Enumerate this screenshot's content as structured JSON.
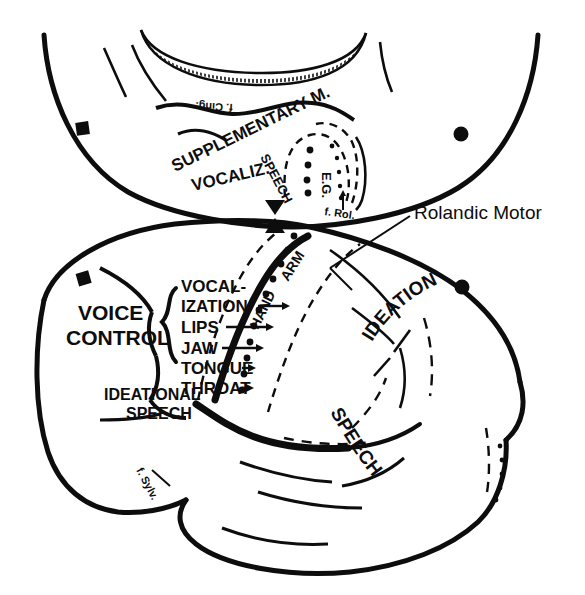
{
  "figure": {
    "kind": "brain-cortical-stimulation-map",
    "views": [
      {
        "name": "medial-view",
        "position": "top"
      },
      {
        "name": "lateral-view",
        "position": "bottom"
      }
    ],
    "ink_color": "#0d0d0d",
    "background_color": "#ffffff"
  },
  "callout": {
    "label": "Rolandic Motor",
    "leader_line": true
  },
  "medial_view": {
    "labels": {
      "supplementary_motor": "SUPPLEMENTARY M.",
      "vocalization": "VOCALIZ.",
      "speech": "SPEECH",
      "eg": "E.G.",
      "fissure_rolandic": "f. Rol.",
      "fissure_cingulate": "f. Cing."
    }
  },
  "lateral_view": {
    "labels": {
      "voice_control_line1": "VOICE",
      "voice_control_line2": "CONTROL",
      "ideational_speech_line1": "IDEATIONAL",
      "ideational_speech_line2": "SPEECH",
      "ideational_arc": "IDEATIONAL",
      "speech_arc": "SPEECH",
      "hand": "HAND",
      "arm": "ARM",
      "fissure_sylvian": "f. Sylv."
    },
    "motor_homunculus": [
      {
        "line1": "VOCAL-",
        "line2": "IZATION",
        "arrow": true
      },
      {
        "line1": "LIPS",
        "line2": "",
        "arrow": true
      },
      {
        "line1": "JAW",
        "line2": "",
        "arrow": true
      },
      {
        "line1": "TONGUE",
        "line2": "",
        "arrow": true
      },
      {
        "line1": "THROAT",
        "line2": "",
        "arrow": true
      }
    ]
  },
  "markers": {
    "square_label": "square-marker",
    "circle_label": "circle-marker",
    "triangle_label": "triangle-marker",
    "square_count": 2,
    "circle_count": 2,
    "triangle_count": 2
  }
}
